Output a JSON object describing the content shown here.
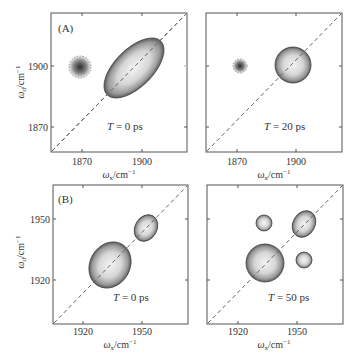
{
  "figure": {
    "panels": [
      {
        "id": "A-left",
        "label": "(A)",
        "annotation": "T = 0 ps",
        "xlabel": "ωx/cm⁻¹",
        "ylabel": "ωd/cm⁻¹",
        "xticks": [
          "1870",
          "1900"
        ],
        "yticks": [
          "1900",
          "1870"
        ]
      },
      {
        "id": "A-right",
        "label": "",
        "annotation": "T = 20 ps",
        "xlabel": "ωx/cm⁻¹",
        "ylabel": "",
        "xticks": [
          "1870",
          "1900"
        ],
        "yticks": []
      },
      {
        "id": "B-left",
        "label": "(B)",
        "annotation": "T = 0 ps",
        "xlabel": "ωx/cm⁻¹",
        "ylabel": "ωd/cm⁻¹",
        "xticks": [
          "1920",
          "1950"
        ],
        "yticks": [
          "1950",
          "1920"
        ]
      },
      {
        "id": "B-right",
        "label": "",
        "annotation": "T = 50 ps",
        "xlabel": "ωx/cm⁻¹",
        "ylabel": "",
        "xticks": [
          "1920",
          "1950"
        ],
        "yticks": []
      }
    ]
  },
  "labels": {
    "A": "(A)",
    "B": "(B)",
    "t0": "T = 0 ps",
    "t20": "T = 20 ps",
    "t50": "T = 50 ps",
    "omega": "ω",
    "x_sub": "x",
    "d_sub": "d",
    "unit": "/cm",
    "exp": "−1",
    "tick_1870": "1870",
    "tick_1900": "1900",
    "tick_1920": "1920",
    "tick_1950": "1950"
  },
  "colors": {
    "frame": "#555555",
    "diagonal": "#666666",
    "peak_edge": "#444444"
  }
}
